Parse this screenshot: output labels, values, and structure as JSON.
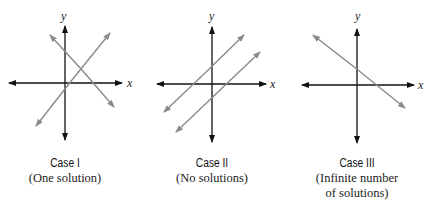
{
  "panels": [
    {
      "id": "case-1",
      "title": "Case I",
      "subtitle": "(One solution)",
      "axis_labels": {
        "x": "x",
        "y": "y"
      },
      "description": "Two lines intersecting at one point"
    },
    {
      "id": "case-2",
      "title": "Case II",
      "subtitle": "(No solutions)",
      "axis_labels": {
        "x": "x",
        "y": "y"
      },
      "description": "Two parallel lines"
    },
    {
      "id": "case-3",
      "title": "Case III",
      "subtitle_line1": "(Infinite number",
      "subtitle_line2": "of solutions)",
      "axis_labels": {
        "x": "x",
        "y": "y"
      },
      "description": "Two coincident lines shown as one"
    }
  ],
  "colors": {
    "axis": "#111111",
    "line": "#8a8a8a"
  }
}
